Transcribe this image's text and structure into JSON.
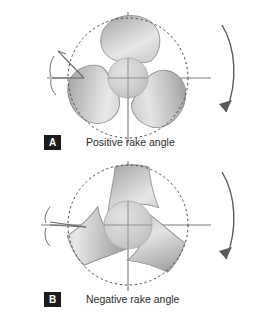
{
  "figure": {
    "background_color": "#ffffff",
    "line_color": "#6f6f6f",
    "blade_edge_color": "#8a8a8a",
    "blade_fill_light": "#e4e4e4",
    "blade_fill_dark": "#9c9c9c",
    "hub_color": "#cfcfcf",
    "tag_background": "#1b1b1b",
    "tag_text_color": "#ffffff",
    "caption_color": "#2b2b2b"
  },
  "panels": [
    {
      "id": "panel-a",
      "tag": "A",
      "caption": "Positive rake angle",
      "blade_count": 3,
      "rake_sign": "positive",
      "rake_indicator": "wide-open-angle",
      "rotation_direction": "clockwise",
      "dashed_circle": true,
      "crosshair_axes": true,
      "hub": true
    },
    {
      "id": "panel-b",
      "tag": "B",
      "caption": "Negative rake angle",
      "blade_count": 3,
      "rake_sign": "negative",
      "rake_indicator": "narrow-flat-angle",
      "rotation_direction": "clockwise",
      "dashed_circle": true,
      "crosshair_axes": true,
      "hub": true
    }
  ],
  "icons": {
    "rotation_arrow": "curved-arrow-clockwise",
    "rake_angle_marker": "angle-vertex-with-arc"
  }
}
